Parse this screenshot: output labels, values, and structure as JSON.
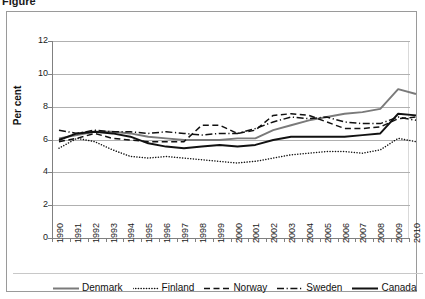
{
  "title_partial": "Figure",
  "axis": {
    "ylabel": "Per cent",
    "yticks": [
      "0",
      "2",
      "4",
      "6",
      "8",
      "10",
      "12"
    ],
    "xticks": [
      "1990",
      "1991",
      "1992",
      "1993",
      "1994",
      "1995",
      "1996",
      "1997",
      "1998",
      "1999",
      "2000",
      "2001",
      "2002",
      "2003",
      "2004",
      "2005",
      "2006",
      "2007",
      "2008",
      "2009",
      "2010"
    ]
  },
  "legend": {
    "position": "bottom",
    "items": [
      {
        "label": "Denmark",
        "style": "solid",
        "color": "#7a7a7a",
        "width": 2.0
      },
      {
        "label": "Finland",
        "style": "dotted",
        "color": "#111111",
        "width": 1.6
      },
      {
        "label": "Norway",
        "style": "dashed",
        "color": "#111111",
        "width": 1.6
      },
      {
        "label": "Sweden",
        "style": "dashdot",
        "color": "#111111",
        "width": 1.6
      },
      {
        "label": "Canada",
        "style": "solid",
        "color": "#111111",
        "width": 2.0
      }
    ]
  },
  "chart_data": {
    "type": "line",
    "title": "Figure",
    "xlabel": "",
    "ylabel": "Per cent",
    "ylim": [
      0,
      12
    ],
    "ytick_step": 2,
    "grid": true,
    "legend_position": "bottom",
    "x": [
      1990,
      1991,
      1992,
      1993,
      1994,
      1995,
      1996,
      1997,
      1998,
      1999,
      2000,
      2001,
      2002,
      2003,
      2004,
      2005,
      2006,
      2007,
      2008,
      2009,
      2010
    ],
    "series": [
      {
        "name": "Denmark",
        "color": "#7a7a7a",
        "style": "solid",
        "values": [
          6.8,
          7.0,
          7.2,
          7.2,
          7.1,
          6.9,
          6.8,
          6.7,
          6.7,
          6.7,
          6.8,
          6.8,
          7.3,
          7.6,
          7.9,
          8.1,
          8.3,
          8.4,
          8.6,
          9.8,
          9.5
        ]
      },
      {
        "name": "Finland",
        "color": "#111111",
        "style": "dotted",
        "values": [
          6.2,
          6.8,
          6.6,
          6.1,
          5.7,
          5.6,
          5.7,
          5.6,
          5.5,
          5.4,
          5.3,
          5.4,
          5.6,
          5.8,
          5.9,
          6.0,
          6.0,
          5.9,
          6.1,
          6.8,
          6.6
        ]
      },
      {
        "name": "Norway",
        "color": "#111111",
        "style": "dashed",
        "values": [
          6.6,
          6.8,
          7.1,
          6.8,
          6.7,
          6.6,
          6.6,
          6.6,
          7.6,
          7.6,
          7.1,
          7.3,
          8.2,
          8.3,
          8.2,
          7.8,
          7.4,
          7.4,
          7.5,
          8.0,
          8.1
        ]
      },
      {
        "name": "Sweden",
        "color": "#111111",
        "style": "dashdot",
        "values": [
          7.3,
          7.1,
          7.3,
          7.2,
          7.2,
          7.1,
          7.2,
          7.1,
          7.0,
          7.1,
          7.1,
          7.4,
          7.8,
          8.1,
          8.0,
          8.1,
          7.8,
          7.7,
          7.7,
          8.1,
          7.9
        ]
      },
      {
        "name": "Canada",
        "color": "#111111",
        "style": "solid",
        "values": [
          6.7,
          7.1,
          7.2,
          7.1,
          6.9,
          6.5,
          6.3,
          6.2,
          6.3,
          6.4,
          6.3,
          6.4,
          6.7,
          6.9,
          6.9,
          6.9,
          6.9,
          7.0,
          7.1,
          8.3,
          8.2
        ]
      }
    ]
  }
}
